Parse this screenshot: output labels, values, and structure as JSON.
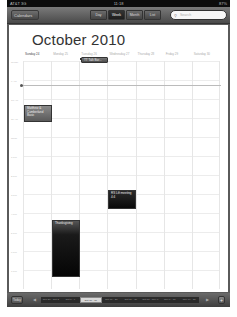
{
  "status_bar": {
    "carrier": "AT&T 3G",
    "time": "11:18",
    "battery": "87%"
  },
  "toolbar": {
    "calendars_label": "Calendars",
    "segments": [
      {
        "label": "Day",
        "active": false
      },
      {
        "label": "Week",
        "active": true
      },
      {
        "label": "Month",
        "active": false
      },
      {
        "label": "List",
        "active": false
      }
    ],
    "search_placeholder": "Search"
  },
  "main": {
    "month_title": "October 2010",
    "days": [
      "Sunday 24",
      "Monday 25",
      "Tuesday 26",
      "Wednesday 27",
      "Thursday 28",
      "Friday 29",
      "Saturday 30"
    ],
    "today_index": 0,
    "hours": [
      "all-day",
      "9 AM",
      "10 AM",
      "11 AM",
      "Noon",
      "1 PM",
      "2 PM",
      "3 PM",
      "4 PM",
      "5 PM",
      "6 PM",
      "7 PM"
    ],
    "events": {
      "talk": "TT Talk Bar...",
      "matthew": "Matthew & Cumberland Basic",
      "rs": "RS Lift meeting 4:4",
      "thanks": "Thanksgiving"
    }
  },
  "bottom_bar": {
    "today_label": "Today",
    "prev": "◀",
    "next": "▶",
    "weeks": [
      "Sep 26 - Oct 2",
      "Oct 3 - 9",
      "Oct 10 - 16",
      "Oct 17 - 23",
      "Oct 24 - 30",
      "Oct 31 - Nov 6",
      "Nov 7 - 13",
      "Nov 14 - 20"
    ],
    "active_week": 2,
    "add_label": "+"
  }
}
